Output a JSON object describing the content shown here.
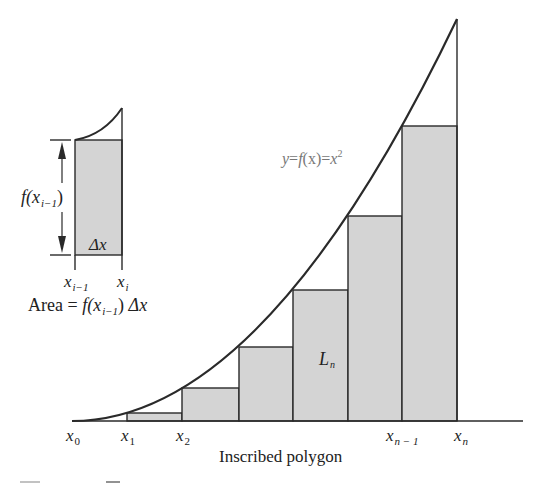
{
  "diagram": {
    "type": "riemann-sum-inscribed-polygon",
    "caption": "Inscribed polygon",
    "curve": {
      "label_y": "y",
      "label_eq1": "=",
      "label_f": "f",
      "label_arg": "(x)",
      "label_eq2": "=",
      "label_x": "x",
      "label_power": "2"
    },
    "region_label": {
      "main": "L",
      "sub": "n"
    },
    "x_labels": [
      {
        "main": "x",
        "sub": "0"
      },
      {
        "main": "x",
        "sub": "1"
      },
      {
        "main": "x",
        "sub": "2"
      },
      {
        "main": "x",
        "sub": "n − 1"
      },
      {
        "main": "x",
        "sub": "n"
      }
    ],
    "rectangles": [
      {
        "x_start": "x1",
        "height_rel": 1
      },
      {
        "x_start": "x2",
        "height_rel": 4
      },
      {
        "x_start": "x3",
        "height_rel": 9
      },
      {
        "x_start": "x4",
        "height_rel": 16
      },
      {
        "x_start": "x5",
        "height_rel": 25
      },
      {
        "x_start": "x6",
        "height_rel": 36
      }
    ],
    "inset": {
      "height_label_f": "f",
      "height_label_open": "(x",
      "height_label_sub": "i−1",
      "height_label_close": ")",
      "width_label": "Δx",
      "left_label": {
        "main": "x",
        "sub": "i−1"
      },
      "right_label": {
        "main": "x",
        "sub": "i"
      },
      "area_prefix": "Area = ",
      "area_f": "f",
      "area_open": "(x",
      "area_sub": "i−1",
      "area_close": ")",
      "area_dx": "Δx"
    },
    "colors": {
      "fill": "#d4d4d4",
      "stroke": "#2a2a2a",
      "curve_label": "#777777"
    }
  }
}
